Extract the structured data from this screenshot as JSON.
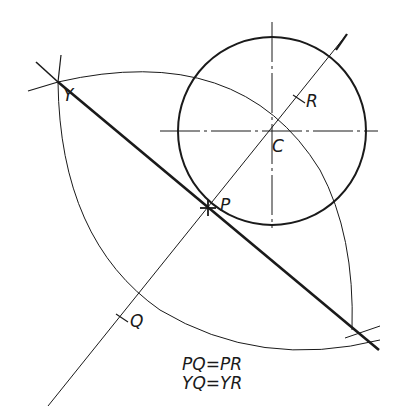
{
  "diagram": {
    "colors": {
      "ink": "#1a1a1a",
      "background": "#ffffff"
    },
    "points": {
      "Y": {
        "label": "Y",
        "x": 58,
        "y": 82
      },
      "P": {
        "label": "P",
        "x": 208,
        "y": 208
      },
      "C": {
        "label": "C",
        "x": 272,
        "y": 131
      },
      "Q": {
        "label": "Q",
        "x": 122,
        "y": 318
      },
      "R": {
        "label": "R",
        "x": 299,
        "y": 99
      }
    },
    "circle": {
      "cx": 272,
      "cy": 131,
      "r": 94
    },
    "equations": [
      "PQ=PR",
      "YQ=YR"
    ]
  }
}
